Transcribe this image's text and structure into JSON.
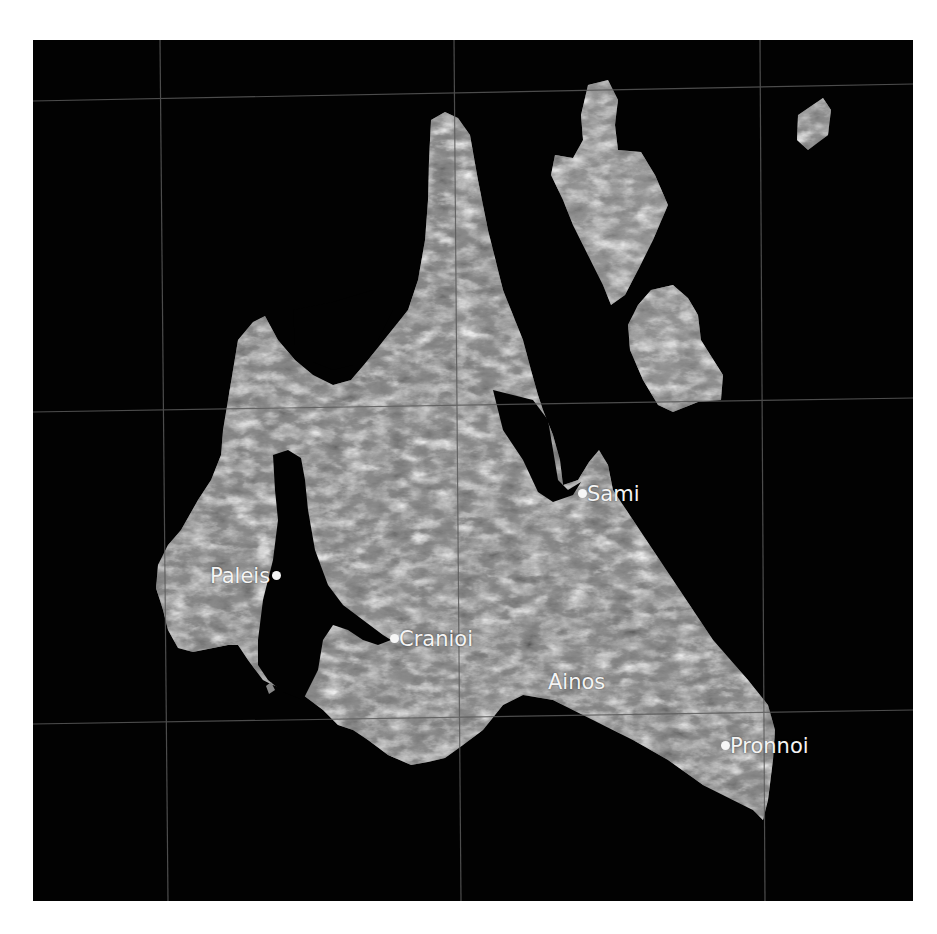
{
  "map": {
    "title": "Kefalonia satellite map",
    "background_color": "#020202",
    "land_color": "#8a8a8a",
    "grid_color": "#5a5a5a",
    "label_color": "#f4f4f4",
    "grid": {
      "vertical_lines": [
        {
          "x1": 127,
          "y1": 0,
          "x2": 135,
          "y2": 861
        },
        {
          "x1": 421,
          "y1": 0,
          "x2": 428,
          "y2": 861
        },
        {
          "x1": 727,
          "y1": 0,
          "x2": 732,
          "y2": 861
        }
      ],
      "horizontal_lines": [
        {
          "x1": 0,
          "y1": 61,
          "x2": 880,
          "y2": 44
        },
        {
          "x1": 0,
          "y1": 372,
          "x2": 880,
          "y2": 358
        },
        {
          "x1": 0,
          "y1": 684,
          "x2": 880,
          "y2": 670
        }
      ]
    },
    "places": [
      {
        "name": "Sami",
        "dot": true,
        "dot_side": "left"
      },
      {
        "name": "Paleis",
        "dot": true,
        "dot_side": "right"
      },
      {
        "name": "Cranioi",
        "dot": true,
        "dot_side": "left"
      },
      {
        "name": "Ainos",
        "dot": false
      },
      {
        "name": "Pronnoi",
        "dot": true,
        "dot_side": "left"
      }
    ]
  }
}
